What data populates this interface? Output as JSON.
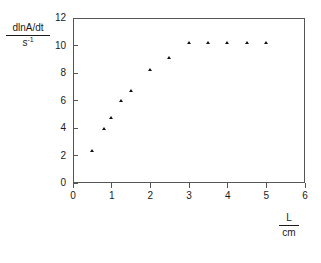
{
  "chart_data": {
    "type": "scatter",
    "title": "",
    "xlabel": "L / cm",
    "ylabel": "dlnA/dt / s^-1",
    "xlim": [
      0,
      6
    ],
    "ylim": [
      0,
      12
    ],
    "xticks": [
      0,
      1,
      2,
      3,
      4,
      5,
      6
    ],
    "yticks": [
      0,
      2,
      4,
      6,
      8,
      10,
      12
    ],
    "xtick_labels": [
      "0",
      "1",
      "2",
      "3",
      "4",
      "5",
      "6"
    ],
    "ytick_labels": [
      "0",
      "2",
      "4",
      "6",
      "8",
      "10",
      "12"
    ],
    "grid": false,
    "legend": null,
    "marker": "triangle",
    "marker_color": "#111111",
    "frame_color": "#555555",
    "x": [
      0.5,
      0.8,
      1.0,
      1.25,
      1.5,
      2.0,
      2.5,
      3.0,
      3.5,
      4.0,
      4.5,
      5.0
    ],
    "y": [
      2.3,
      3.9,
      4.7,
      6.0,
      6.7,
      8.2,
      9.1,
      10.2,
      10.2,
      10.2,
      10.2,
      10.2
    ],
    "points": [
      {
        "x": 0.5,
        "y": 2.3
      },
      {
        "x": 0.8,
        "y": 3.9
      },
      {
        "x": 1.0,
        "y": 4.7
      },
      {
        "x": 1.25,
        "y": 6.0
      },
      {
        "x": 1.5,
        "y": 6.7
      },
      {
        "x": 2.0,
        "y": 8.2
      },
      {
        "x": 2.5,
        "y": 9.1
      },
      {
        "x": 3.0,
        "y": 10.2
      },
      {
        "x": 3.5,
        "y": 10.2
      },
      {
        "x": 4.0,
        "y": 10.2
      },
      {
        "x": 4.5,
        "y": 10.2
      },
      {
        "x": 5.0,
        "y": 10.2
      }
    ]
  },
  "axis_labels": {
    "y_numerator": "dlnA/dt",
    "y_denominator_base": "s",
    "y_denominator_exponent": "-1",
    "x_numerator": "L",
    "x_denominator": "cm"
  },
  "caption": {
    "text": ""
  }
}
